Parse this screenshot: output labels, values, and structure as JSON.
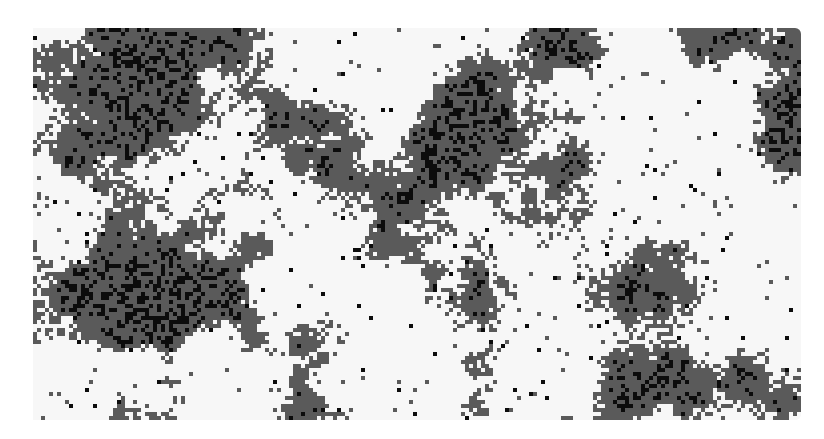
{
  "map": {
    "type": "categorical-raster",
    "grid": {
      "cols": 192,
      "rows": 98,
      "cell_px": 4
    },
    "bounds_px": {
      "left": 33,
      "top": 28,
      "width": 768,
      "height": 392
    },
    "classes": [
      {
        "id": 0,
        "name": "class-white",
        "color": "#f7f7f7",
        "share": 0.58
      },
      {
        "id": 1,
        "name": "class-gray",
        "color": "#5a5a5a",
        "share": 0.36
      },
      {
        "id": 2,
        "name": "class-black",
        "color": "#0c0c0c",
        "share": 0.06
      }
    ],
    "generator": {
      "seed": 73,
      "octaves": 4,
      "base_scale": 22,
      "gray_threshold": 0.53,
      "black_threshold": 0.62,
      "speckle": 0.05
    }
  }
}
